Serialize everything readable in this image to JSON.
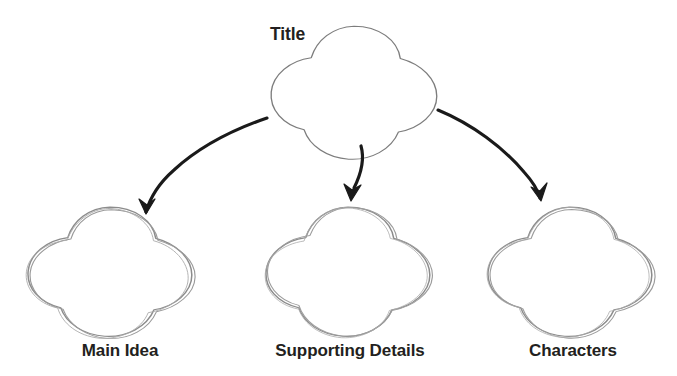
{
  "diagram": {
    "type": "graphic-organizer",
    "style": "hand-drawn sketch, 5-lobed flower/star bubbles with pencil outlines",
    "background_color": "#ffffff",
    "shape_stroke_color": "#8a8a8a",
    "arrow_color": "#1a1a1a",
    "text_color": "#231f20",
    "root": {
      "id": "title-node",
      "label": "Title",
      "label_position": "left-of-shape"
    },
    "children": [
      {
        "id": "main-idea-node",
        "label": "Main Idea",
        "label_position": "below-shape"
      },
      {
        "id": "supporting-details-node",
        "label": "Supporting Details",
        "label_position": "below-shape"
      },
      {
        "id": "characters-node",
        "label": "Characters",
        "label_position": "below-shape"
      }
    ],
    "connectors": [
      {
        "id": "arrow-title-to-main-idea",
        "from": "title-node",
        "to": "main-idea-node",
        "shape": "curved",
        "direction": "down-left"
      },
      {
        "id": "arrow-title-to-supporting-details",
        "from": "title-node",
        "to": "supporting-details-node",
        "shape": "short-curved",
        "direction": "down"
      },
      {
        "id": "arrow-title-to-characters",
        "from": "title-node",
        "to": "characters-node",
        "shape": "curved",
        "direction": "down-right"
      }
    ]
  }
}
